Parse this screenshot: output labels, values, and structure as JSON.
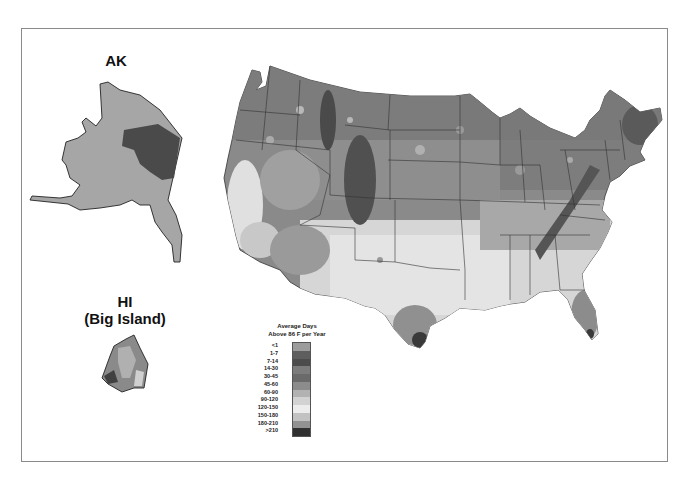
{
  "map": {
    "alaska_label": "AK",
    "hawaii_label_line1": "HI",
    "hawaii_label_line2": "(Big Island)"
  },
  "legend": {
    "title_line1": "Average Days",
    "title_line2": "Above 86 F per Year",
    "bins": [
      {
        "label": "<1",
        "color": "#9c9c9c"
      },
      {
        "label": "1-7",
        "color": "#5e5e5e"
      },
      {
        "label": "7-14",
        "color": "#4c4c4c"
      },
      {
        "label": "14-30",
        "color": "#7c7c7c"
      },
      {
        "label": "30-45",
        "color": "#6a6a6a"
      },
      {
        "label": "45-60",
        "color": "#8c8c8c"
      },
      {
        "label": "60-90",
        "color": "#b2b2b2"
      },
      {
        "label": "90-120",
        "color": "#d2d2d2"
      },
      {
        "label": "120-150",
        "color": "#ececec"
      },
      {
        "label": "150-180",
        "color": "#c2c2c2"
      },
      {
        "label": "180-210",
        "color": "#929292"
      },
      {
        "label": ">210",
        "color": "#303030"
      }
    ]
  }
}
